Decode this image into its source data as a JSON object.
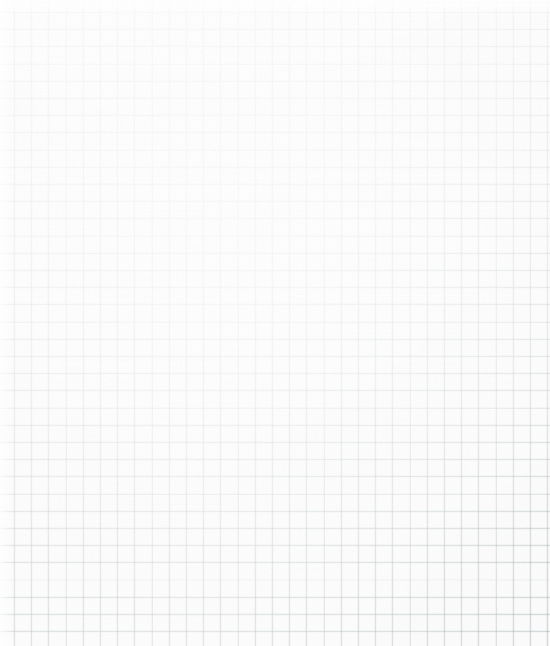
{
  "sheet": {
    "subject": "blank graph paper",
    "description": "Scanned sheet of blank quadrille / graph paper with no writing, drawings or text",
    "width_px": 550,
    "height_px": 646,
    "orientation": "portrait",
    "content_text": "",
    "has_text": false,
    "has_drawing": false,
    "has_margin_rule": false
  },
  "grid": {
    "style": "uniform square quadrille",
    "cell_size_px": 17.2,
    "columns_visible": 32,
    "rows_visible": 37,
    "origin_offset_x_px": 14,
    "origin_offset_y_px": 12,
    "line_weight_px": 0.9,
    "major_lines": "none",
    "line_color": "#a0a8ac",
    "line_opacity": 0.3
  },
  "colors": {
    "paper_background": "#fdfdfd",
    "grid_line": "#a0a8ac",
    "grid_line_rendered_light": "#f4f5f5",
    "grid_line_rendered_dark": "#e6e8e9",
    "highlight_wash": "#ffffff"
  },
  "scan_artifacts": {
    "vignette": "lines progressively more visible toward bottom and right edges",
    "top_edge": "washed out / overexposed",
    "center": "brightest region, grid nearly invisible",
    "texture": "fine paper fiber noise",
    "speck_near_top_right": true,
    "speck_near_bottom_left": true
  }
}
